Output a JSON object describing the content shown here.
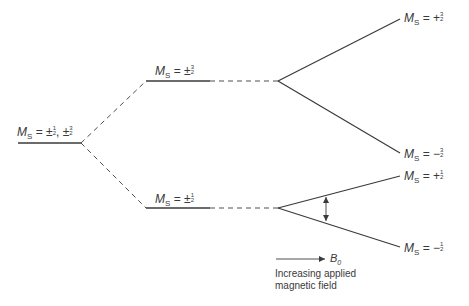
{
  "diagram": {
    "type": "energy-level-splitting",
    "colors": {
      "line": "#3a3a3a",
      "background": "#ffffff"
    },
    "levels": [
      {
        "id": "initial",
        "symbol": "M",
        "subscript": "S",
        "relation": "=",
        "value_text": "±1/2, ±3/2",
        "parts": [
          {
            "sign": "±",
            "num": "1",
            "den": "2"
          },
          {
            "sign": "±",
            "num": "3",
            "den": "2"
          }
        ]
      },
      {
        "id": "zfs-upper",
        "symbol": "M",
        "subscript": "S",
        "relation": "=",
        "value_text": "±3/2",
        "parts": [
          {
            "sign": "±",
            "num": "3",
            "den": "2"
          }
        ]
      },
      {
        "id": "zfs-lower",
        "symbol": "M",
        "subscript": "S",
        "relation": "=",
        "value_text": "±1/2",
        "parts": [
          {
            "sign": "±",
            "num": "1",
            "den": "2"
          }
        ]
      },
      {
        "id": "zeeman-plus-3-2",
        "symbol": "M",
        "subscript": "S",
        "relation": "=",
        "value_text": "+3/2",
        "parts": [
          {
            "sign": "+",
            "num": "3",
            "den": "2"
          }
        ]
      },
      {
        "id": "zeeman-minus-3-2",
        "symbol": "M",
        "subscript": "S",
        "relation": "=",
        "value_text": "−3/2",
        "parts": [
          {
            "sign": "−",
            "num": "3",
            "den": "2"
          }
        ]
      },
      {
        "id": "zeeman-plus-1-2",
        "symbol": "M",
        "subscript": "S",
        "relation": "=",
        "value_text": "+1/2",
        "parts": [
          {
            "sign": "+",
            "num": "1",
            "den": "2"
          }
        ]
      },
      {
        "id": "zeeman-minus-1-2",
        "symbol": "M",
        "subscript": "S",
        "relation": "=",
        "value_text": "−1/2",
        "parts": [
          {
            "sign": "−",
            "num": "1",
            "den": "2"
          }
        ]
      }
    ],
    "field_arrow": {
      "symbol": "B",
      "subscript": "0",
      "caption_line1": "Increasing applied",
      "caption_line2": "magnetic field"
    },
    "transition_arrow": {
      "between": [
        "zeeman-plus-1-2",
        "zeeman-minus-1-2"
      ],
      "style": "double-headed"
    }
  }
}
